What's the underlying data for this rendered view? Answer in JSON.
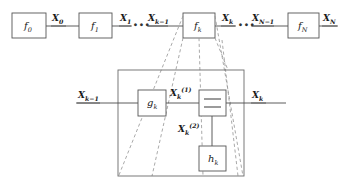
{
  "figure": {
    "type": "block-flow-diagram"
  },
  "chain": {
    "blocks": [
      {
        "id": "f0",
        "label_base": "f",
        "label_sub": "0",
        "x": 12,
        "y": 13,
        "w": 34,
        "h": 25
      },
      {
        "id": "f1",
        "label_base": "f",
        "label_sub": "1",
        "x": 79,
        "y": 13,
        "w": 33,
        "h": 25
      },
      {
        "id": "fk",
        "label_base": "f",
        "label_sub": "k",
        "x": 183,
        "y": 13,
        "w": 32,
        "h": 25
      },
      {
        "id": "fN",
        "label_base": "f",
        "label_sub": "N",
        "x": 288,
        "y": 13,
        "w": 31,
        "h": 25
      }
    ],
    "edge_labels": [
      {
        "id": "x0",
        "base": "X",
        "sub": "0",
        "x": 52,
        "y": 14
      },
      {
        "id": "x1",
        "base": "X",
        "sub": "1",
        "x": 120,
        "y": 14
      },
      {
        "id": "xkm1",
        "base": "X",
        "sub": "k−1",
        "x": 148,
        "y": 14
      },
      {
        "id": "xk_top",
        "base": "X",
        "sub": "k",
        "x": 222,
        "y": 14
      },
      {
        "id": "xNm1",
        "base": "X",
        "sub": "N−1",
        "x": 252,
        "y": 14
      },
      {
        "id": "xN",
        "base": "X",
        "sub": "N",
        "x": 323,
        "y": 14
      }
    ],
    "ellipses": [
      {
        "id": "ellipsis-left",
        "text": "∙∙∙",
        "x": 133,
        "y": 22
      },
      {
        "id": "ellipsis-right",
        "text": "∙∙∙",
        "x": 238,
        "y": 22
      }
    ]
  },
  "detail": {
    "frame": {
      "x": 118,
      "y": 70,
      "w": 126,
      "h": 106
    },
    "blocks": [
      {
        "id": "gk",
        "label_base": "g",
        "label_sub": "k",
        "x": 138,
        "y": 90,
        "w": 28,
        "h": 26
      },
      {
        "id": "combine",
        "label_base": "",
        "label_sub": "",
        "x": 199,
        "y": 90,
        "w": 27,
        "h": 26,
        "glyph": "two-horizontal-bars"
      },
      {
        "id": "hk",
        "label_base": "h",
        "label_sub": "k",
        "x": 199,
        "y": 146,
        "w": 27,
        "h": 25
      }
    ],
    "edge_labels": [
      {
        "id": "xkm1_detail",
        "base": "X",
        "sub": "k−1",
        "x": 78,
        "y": 91
      },
      {
        "id": "xk1",
        "base": "X",
        "sub": "k",
        "sup": "(1)",
        "x": 170,
        "y": 88
      },
      {
        "id": "xk2",
        "base": "X",
        "sub": "k",
        "sup": "(2)",
        "x": 178,
        "y": 124
      },
      {
        "id": "xk_detail",
        "base": "X",
        "sub": "k",
        "x": 252,
        "y": 91
      }
    ]
  },
  "colors": {
    "stroke": "#4a4a4a",
    "box_stroke": "#555555",
    "dashed_stroke": "#9a9a9a",
    "text": "#1a1a1a",
    "background": "#ffffff"
  }
}
